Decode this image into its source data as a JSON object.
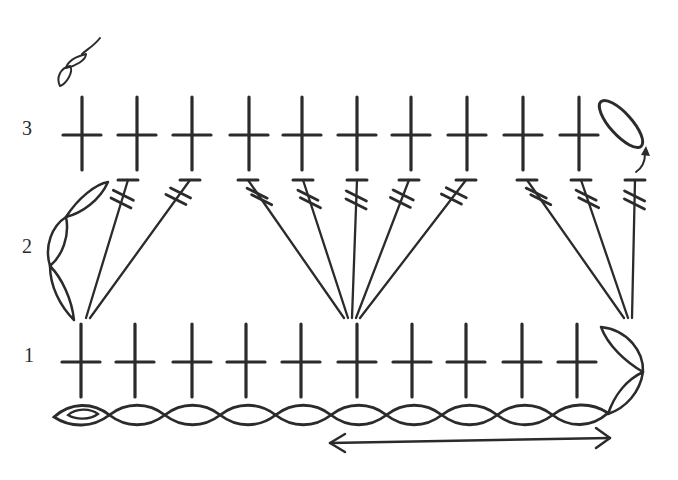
{
  "ink_color": "#2b2b2b",
  "background": "#ffffff",
  "row_labels": [
    {
      "label": "3",
      "x": 22,
      "y": 118
    },
    {
      "label": "2",
      "x": 22,
      "y": 236
    },
    {
      "label": "1",
      "x": 22,
      "y": 345
    }
  ],
  "legend_symbol": {
    "type": "chain-twist",
    "x": 60,
    "y": 40
  },
  "rows": {
    "row3": {
      "stitch": "single-crochet",
      "count": 10,
      "y": 135,
      "x": [
        82,
        137,
        192,
        249,
        302,
        357,
        411,
        467,
        523,
        579
      ],
      "turning_chain": {
        "type": "chain",
        "count": 1
      }
    },
    "row2": {
      "stitch": "double-treble",
      "count": 10,
      "groups": [
        {
          "base_x": 88,
          "tops": [
            128,
            190
          ]
        },
        {
          "base_x": 352,
          "tops": [
            248,
            303,
            357,
            409,
            466
          ]
        },
        {
          "base_x": 628,
          "tops": [
            527,
            581,
            635
          ]
        }
      ],
      "turning_chain": {
        "type": "chain",
        "count": 3
      }
    },
    "row1": {
      "stitch": "single-crochet",
      "count": 10,
      "y": 362,
      "x": [
        81,
        135,
        192,
        246,
        301,
        357,
        412,
        466,
        522,
        577
      ],
      "turning_chain": {
        "type": "chain",
        "count": 2
      }
    },
    "foundation": {
      "stitch": "chain",
      "count": 10,
      "slip_knot": true,
      "y": 415
    }
  },
  "repeat_arrow": {
    "x1": 330,
    "x2": 610,
    "y": 440,
    "label": "repeat"
  }
}
